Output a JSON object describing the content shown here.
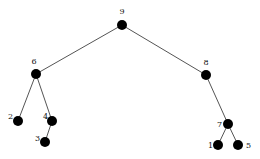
{
  "diagram": {
    "type": "tree",
    "nodes": [
      {
        "id": "9",
        "label": "9",
        "x": 122,
        "y": 25,
        "lx": 122,
        "ly": 14,
        "anchor": "middle"
      },
      {
        "id": "6",
        "label": "6",
        "x": 36,
        "y": 74,
        "lx": 34,
        "ly": 64,
        "anchor": "middle"
      },
      {
        "id": "8",
        "label": "8",
        "x": 206,
        "y": 75,
        "lx": 206,
        "ly": 65,
        "anchor": "middle"
      },
      {
        "id": "2",
        "label": "2",
        "x": 18,
        "y": 121,
        "lx": 13,
        "ly": 119,
        "anchor": "end"
      },
      {
        "id": "4",
        "label": "4",
        "x": 52,
        "y": 121,
        "lx": 48,
        "ly": 119,
        "anchor": "end"
      },
      {
        "id": "3",
        "label": "3",
        "x": 45,
        "y": 142,
        "lx": 40,
        "ly": 141,
        "anchor": "end"
      },
      {
        "id": "7",
        "label": "7",
        "x": 228,
        "y": 124,
        "lx": 222,
        "ly": 127,
        "anchor": "end"
      },
      {
        "id": "1",
        "label": "1",
        "x": 218,
        "y": 145,
        "lx": 213,
        "ly": 148,
        "anchor": "end"
      },
      {
        "id": "5",
        "label": "5",
        "x": 238,
        "y": 145,
        "lx": 246,
        "ly": 148,
        "anchor": "start"
      }
    ],
    "edges": [
      {
        "from": "9",
        "to": "6"
      },
      {
        "from": "9",
        "to": "8"
      },
      {
        "from": "6",
        "to": "2"
      },
      {
        "from": "6",
        "to": "4"
      },
      {
        "from": "4",
        "to": "3"
      },
      {
        "from": "8",
        "to": "7"
      },
      {
        "from": "7",
        "to": "1"
      },
      {
        "from": "7",
        "to": "5"
      }
    ],
    "node_color": "#000000",
    "edge_color": "#555555"
  }
}
